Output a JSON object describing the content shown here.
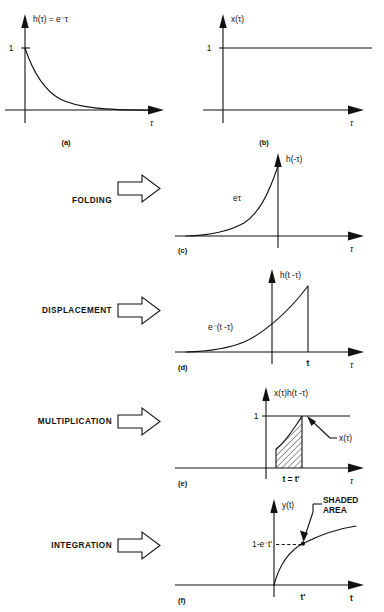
{
  "figure": {
    "type": "diagram",
    "panels": [
      {
        "tag": "(a)",
        "curve_label": "h(τ) = e⁻τ",
        "y_tick": "1",
        "x_axis_label": "τ",
        "description": "decaying exponential starting at 1",
        "function": "exp(-tau) for tau>0"
      },
      {
        "tag": "(b)",
        "curve_label": "x(τ)",
        "y_tick": "1",
        "x_axis_label": "τ",
        "description": "unit step constant at 1",
        "function": "1"
      },
      {
        "tag": "(c)",
        "curve_label": "h(-τ)",
        "inner_label": "eτ",
        "x_axis_label": "τ",
        "description": "folded exponential rising to 1 at tau=0",
        "function": "exp(tau) for tau<0"
      },
      {
        "tag": "(d)",
        "curve_label": "h(t -τ)",
        "inner_label": "e⁻(t -τ)",
        "x_tick": "t",
        "x_axis_label": "τ",
        "description": "shifted folded exponential peaking at tau=t",
        "function": "exp(-(t-tau)) for tau<t"
      },
      {
        "tag": "(e)",
        "curve_label": "x(τ)h(t -τ)",
        "y_tick": "1",
        "x_tick": "t = t'",
        "callout": "x(τ)",
        "x_axis_label": "τ",
        "description": "product with hatched shaded area from 0 to t",
        "function": "exp(-(t-tau)) for 0<tau<t"
      },
      {
        "tag": "(f)",
        "curve_label": "y(t)",
        "y_tick": "1-e⁻t'",
        "x_tick": "t'",
        "callout": "SHADED\nAREA",
        "callout_line1": "SHADED",
        "callout_line2": "AREA",
        "x_axis_label": "t",
        "description": "saturating convolution result",
        "function": "1 - exp(-t) for t>0"
      }
    ],
    "operations": [
      {
        "label": "FOLDING",
        "arrow": "block-arrow-right"
      },
      {
        "label": "DISPLACEMENT",
        "arrow": "block-arrow-right"
      },
      {
        "label": "MULTIPLICATION",
        "arrow": "block-arrow-right"
      },
      {
        "label": "INTEGRATION",
        "arrow": "block-arrow-right"
      }
    ],
    "colors": {
      "ink": "#111111",
      "background": "#ffffff"
    }
  }
}
